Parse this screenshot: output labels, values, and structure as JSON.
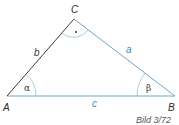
{
  "diagram": {
    "vertices": {
      "A": {
        "label": "A",
        "x": 7,
        "y": 96
      },
      "B": {
        "label": "B",
        "x": 175,
        "y": 96
      },
      "C": {
        "label": "C",
        "x": 74,
        "y": 19
      }
    },
    "sides": {
      "a": {
        "label": "a",
        "color": "#3a8fc4"
      },
      "b": {
        "label": "b",
        "color": "#3a3a3a"
      },
      "c": {
        "label": "c",
        "color": "#3a8fc4"
      }
    },
    "angles": {
      "alpha": {
        "label": "α"
      },
      "beta": {
        "label": "β"
      },
      "gamma": {
        "label": "·",
        "note": "right angle marker"
      }
    },
    "caption": "Bild 3/72",
    "colors": {
      "accent": "#3a8fc4",
      "dark_edge": "#3a3a3a",
      "arc": "#8ab6cf"
    }
  }
}
